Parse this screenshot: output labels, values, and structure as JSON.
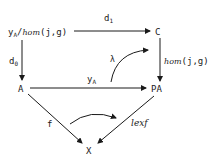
{
  "nodes": {
    "top_left": {
      "base": "y",
      "sub": "A",
      "rest_prefix": "/",
      "hom": "hom",
      "args": "(j,g)"
    },
    "top_right": "C",
    "mid_left": "A",
    "mid_right": "PA",
    "bottom": "X"
  },
  "arrows": {
    "d1": {
      "base": "d",
      "sub": "1"
    },
    "d0": {
      "base": "d",
      "sub": "0"
    },
    "right_vertical": {
      "hom": "hom",
      "args": "(j,g)"
    },
    "yA": {
      "base": "y",
      "sub": "A"
    },
    "lambda": "λ",
    "f": "f",
    "lexf": "lexf"
  },
  "colors": {
    "ink": "#1a1a1a",
    "background": "#ffffff"
  }
}
